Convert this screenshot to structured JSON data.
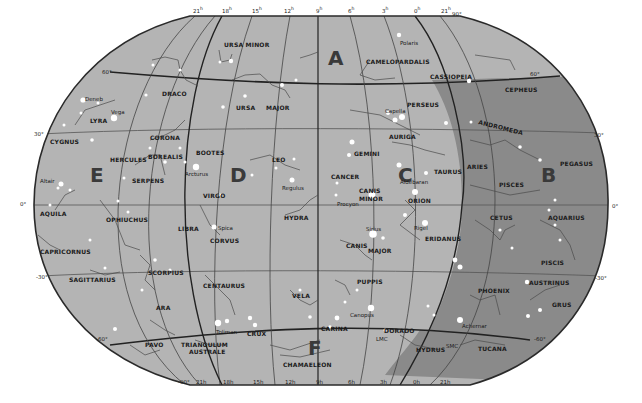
{
  "map": {
    "projection": "elliptical whole-sky star chart (celestial sphere)",
    "colors": {
      "sky_light": "#b4b4b4",
      "sky_dark": "#8a8a8a",
      "outline": "#2a2a2a",
      "star": "#ffffff",
      "background": "#ffffff"
    },
    "zones": [
      "A",
      "B",
      "C",
      "D",
      "E",
      "F"
    ],
    "ra_ticks_top": [
      "21",
      "18",
      "15",
      "12",
      "9",
      "6",
      "3",
      "0",
      "21"
    ],
    "ra_ticks_bottom": [
      "21",
      "18",
      "15",
      "12",
      "9",
      "6",
      "3",
      "0",
      "21"
    ],
    "ra_unit": "h",
    "dec_ticks_left": [
      "60°",
      "30°",
      "0°",
      "-30°",
      "-60°"
    ],
    "dec_ticks_right": [
      "60°",
      "30°",
      "0°",
      "-30°",
      "-60°"
    ],
    "pole_north": "90°",
    "pole_south": "-90°",
    "constellations": [
      "URSA MINOR",
      "DRACO",
      "URSA",
      "MAJOR",
      "CAMELOPARDALIS",
      "CASSIOPEIA",
      "CEPHEUS",
      "LYRA",
      "CYGNUS",
      "CORONA",
      "BOREALIS",
      "HERCULES",
      "BOOTES",
      "LEO",
      "GEMINI",
      "PERSEUS",
      "AURIGA",
      "ANDROMEDA",
      "PEGASUS",
      "ARIES",
      "TAURUS",
      "PISCES",
      "SERPENS",
      "VIRGO",
      "CANCER",
      "CANIS",
      "MINOR",
      "ORION",
      "AQUILA",
      "OPHIUCHUS",
      "CETUS",
      "AQUARIUS",
      "LIBRA",
      "CORVUS",
      "HYDRA",
      "CANIS",
      "MAJOR",
      "ERIDANUS",
      "CAPRICORNUS",
      "SCORPIUS",
      "SAGITTARIUS",
      "PUPPIS",
      "PISCIS",
      "AUSTRINUS",
      "CENTAURUS",
      "VELA",
      "PHOENIX",
      "GRUS",
      "ARA",
      "CARINA",
      "DORADO",
      "CRUX",
      "PAVO",
      "TRIANGULUM",
      "AUSTRALE",
      "HYDRUS",
      "TUCANA",
      "CHAMAELEON"
    ],
    "stars": [
      "Polaris",
      "Deneb",
      "Vega",
      "Capella",
      "Arcturus",
      "Regulus",
      "Aldebaran",
      "Altair",
      "Procyon",
      "Spica",
      "Rigel",
      "Sirius",
      "Canopus",
      "Achernar",
      "Toliman"
    ],
    "objects": [
      "LMC",
      "SMC"
    ]
  }
}
